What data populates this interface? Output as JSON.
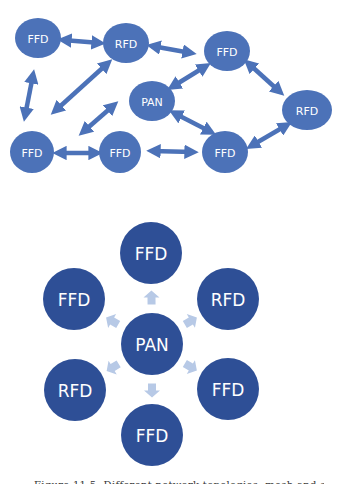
{
  "mesh_topology": {
    "node_color": "#4c72b8",
    "nodes": [
      {
        "id": "m1",
        "label": "FFD",
        "cx": 38,
        "cy": 38,
        "rx": 23,
        "ry": 20
      },
      {
        "id": "m2",
        "label": "RFD",
        "cx": 126,
        "cy": 43,
        "rx": 23,
        "ry": 20
      },
      {
        "id": "m3",
        "label": "FFD",
        "cx": 227,
        "cy": 51,
        "rx": 23,
        "ry": 20
      },
      {
        "id": "m4",
        "label": "PAN",
        "cx": 152,
        "cy": 101,
        "rx": 23,
        "ry": 20
      },
      {
        "id": "m5",
        "label": "RFD",
        "cx": 307,
        "cy": 110,
        "rx": 25,
        "ry": 20
      },
      {
        "id": "m6",
        "label": "FFD",
        "cx": 32,
        "cy": 152,
        "rx": 22,
        "ry": 21
      },
      {
        "id": "m7",
        "label": "FFD",
        "cx": 120,
        "cy": 152,
        "rx": 21,
        "ry": 21
      },
      {
        "id": "m8",
        "label": "FFD",
        "cx": 225,
        "cy": 152,
        "rx": 23,
        "ry": 21
      }
    ],
    "links": [
      {
        "from": "m1",
        "to": "m2",
        "x1": 63,
        "y1": 40,
        "x2": 100,
        "y2": 43
      },
      {
        "from": "m2",
        "to": "m3",
        "x1": 152,
        "y1": 46,
        "x2": 191,
        "y2": 53
      },
      {
        "from": "m1",
        "to": "m6",
        "x1": 33,
        "y1": 75,
        "x2": 25,
        "y2": 116
      },
      {
        "from": "m2",
        "to": "m6",
        "x1": 108,
        "y1": 63,
        "x2": 55,
        "y2": 111
      },
      {
        "from": "m4",
        "to": "m7",
        "x1": 114,
        "y1": 105,
        "x2": 83,
        "y2": 132
      },
      {
        "from": "m3",
        "to": "m4",
        "x1": 206,
        "y1": 66,
        "x2": 172,
        "y2": 87
      },
      {
        "from": "m3",
        "to": "m5",
        "x1": 248,
        "y1": 63,
        "x2": 280,
        "y2": 92
      },
      {
        "from": "m4",
        "to": "m8",
        "x1": 174,
        "y1": 113,
        "x2": 211,
        "y2": 132
      },
      {
        "from": "m8",
        "to": "m5",
        "x1": 251,
        "y1": 146,
        "x2": 287,
        "y2": 125
      },
      {
        "from": "m6",
        "to": "m7",
        "x1": 58,
        "y1": 153,
        "x2": 97,
        "y2": 153
      },
      {
        "from": "m7",
        "to": "m8",
        "x1": 152,
        "y1": 151,
        "x2": 193,
        "y2": 152
      }
    ]
  },
  "star_topology": {
    "node_color": "#2e4f96",
    "arrow_color": "#b7c9e6",
    "center": {
      "label": "PAN",
      "cx": 152,
      "cy": 344,
      "r": 31
    },
    "satellites": [
      {
        "label": "FFD",
        "cx": 151,
        "cy": 253,
        "r": 31
      },
      {
        "label": "RFD",
        "cx": 228,
        "cy": 299,
        "r": 31
      },
      {
        "label": "FFD",
        "cx": 228,
        "cy": 389,
        "r": 31
      },
      {
        "label": "FFD",
        "cx": 152,
        "cy": 435,
        "r": 31
      },
      {
        "label": "RFD",
        "cx": 75,
        "cy": 390,
        "r": 31
      },
      {
        "label": "FFD",
        "cx": 74,
        "cy": 299,
        "r": 31
      }
    ]
  },
  "caption": {
    "text": "Figure 11.5: Different network topologies: mesh and star"
  }
}
